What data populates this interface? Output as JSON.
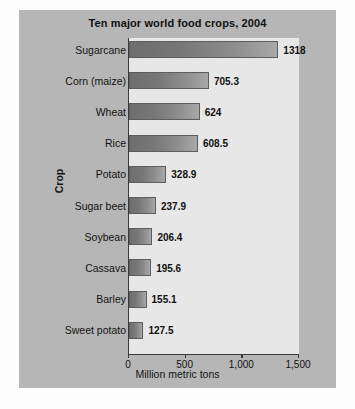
{
  "chart_data": {
    "type": "bar",
    "orientation": "horizontal",
    "title": "Ten major world food crops, 2004",
    "xlabel": "Million metric tons",
    "ylabel": "Crop",
    "xlim": [
      0,
      1500
    ],
    "xticks": [
      0,
      500,
      1000,
      1500
    ],
    "xtick_labels": [
      "0",
      "500",
      "1,000",
      "1,500"
    ],
    "grid": false,
    "legend": null,
    "categories": [
      "Sugarcane",
      "Corn (maize)",
      "Wheat",
      "Rice",
      "Potato",
      "Sugar beet",
      "Soybean",
      "Cassava",
      "Barley",
      "Sweet potato"
    ],
    "values": [
      1318,
      705.3,
      624,
      608.5,
      328.9,
      237.9,
      206.4,
      195.6,
      155.1,
      127.5
    ],
    "value_labels": [
      "1318",
      "705.3",
      "624",
      "608.5",
      "328.9",
      "237.9",
      "206.4",
      "195.6",
      "155.1",
      "127.5"
    ]
  },
  "colors": {
    "page_background": "#fdfdfd",
    "panel_background": "#b6b6b6",
    "plot_background": "#e7e7e7",
    "bar_gradient_start": "#6e6e6e",
    "bar_gradient_end": "#a8a8a8",
    "axis_line": "#3a3a3a",
    "text": "#131313"
  }
}
